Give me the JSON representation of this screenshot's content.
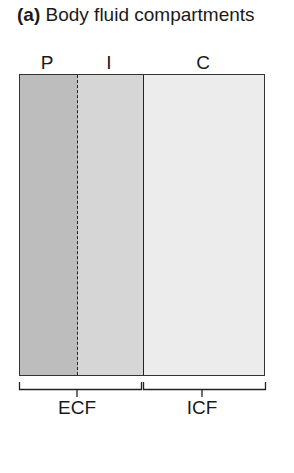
{
  "title": {
    "prefix": "(a)",
    "text": "Body fluid compartments"
  },
  "compartments": [
    {
      "label": "P",
      "color": "#bdbdbd"
    },
    {
      "label": "I",
      "color": "#d6d6d6"
    },
    {
      "label": "C",
      "color": "#ececec"
    }
  ],
  "groups": [
    {
      "label": "ECF"
    },
    {
      "label": "ICF"
    }
  ]
}
